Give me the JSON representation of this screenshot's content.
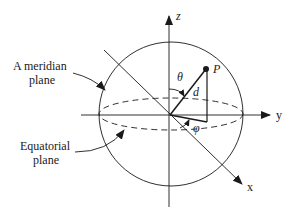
{
  "labels": {
    "meridian_line1": "A meridian",
    "meridian_line2": "plane",
    "equatorial_line1": "Equatorial",
    "equatorial_line2": "plane",
    "axis_z": "z",
    "axis_y": "y",
    "axis_x": "x",
    "point": "P",
    "distance": "d",
    "polar_angle": "θ",
    "azimuth_angle": "φ"
  },
  "colors": {
    "stroke": "#1a1a1a",
    "background": "#ffffff"
  }
}
